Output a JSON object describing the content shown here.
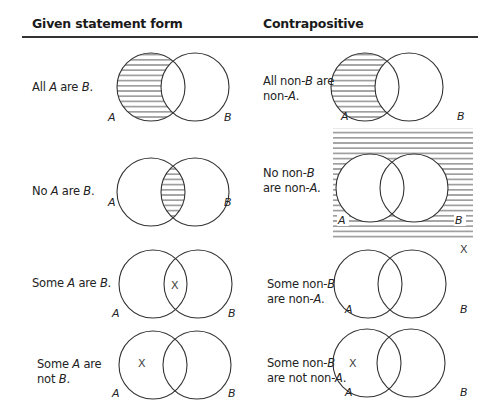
{
  "header": {
    "col1": "Given statement form",
    "col2": "Contrapositive"
  },
  "rows": [
    {
      "given": {
        "prefix": "All ",
        "a": "A",
        "mid": " are ",
        "b": "B",
        "suffix": "."
      },
      "contra": {
        "line1_prefix": "All non-",
        "line1_var": "B",
        "line1_suffix": " are",
        "line2_prefix": "non-",
        "line2_var": "A",
        "line2_suffix": "."
      },
      "given_diagram": {
        "shaded": "A-only",
        "mark": ""
      },
      "contra_diagram": {
        "shaded": "A-only",
        "mark": ""
      }
    },
    {
      "given": {
        "prefix": "No ",
        "a": "A",
        "mid": " are ",
        "b": "B",
        "suffix": "."
      },
      "contra": {
        "line1_prefix": "No non-",
        "line1_var": "B",
        "line1_suffix": "",
        "line2_prefix": "are non-",
        "line2_var": "A",
        "line2_suffix": "."
      },
      "given_diagram": {
        "shaded": "intersection",
        "mark": ""
      },
      "contra_diagram": {
        "shaded": "outside-both",
        "mark": ""
      }
    },
    {
      "given": {
        "prefix": "Some ",
        "a": "A",
        "mid": " are ",
        "b": "B",
        "suffix": "."
      },
      "contra": {
        "line1_prefix": "Some non-",
        "line1_var": "B",
        "line1_suffix": "",
        "line2_prefix": "are non-",
        "line2_var": "A",
        "line2_suffix": "."
      },
      "given_diagram": {
        "shaded": "none",
        "mark": "X"
      },
      "contra_diagram": {
        "shaded": "none",
        "mark": "X"
      }
    },
    {
      "given": {
        "line1_prefix": "Some ",
        "line1_var": "A",
        "line1_suffix": " are",
        "line2_prefix": "not ",
        "line2_var": "B",
        "line2_suffix": "."
      },
      "contra": {
        "line1_prefix": "Some non-",
        "line1_var": "B",
        "line1_suffix": "",
        "line2_prefix": "are not non-",
        "line2_var": "A",
        "line2_suffix": "."
      },
      "given_diagram": {
        "shaded": "none",
        "mark": "X"
      },
      "contra_diagram": {
        "shaded": "none",
        "mark": "X"
      }
    }
  ],
  "labels": {
    "a": "A",
    "b": "B",
    "x": "X"
  }
}
